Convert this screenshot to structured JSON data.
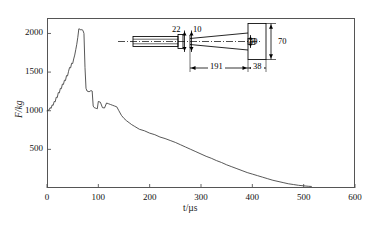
{
  "chart_data": {
    "type": "line",
    "title": "",
    "xlabel": "t/µs",
    "ylabel": "F/kg",
    "xlim": [
      0,
      600
    ],
    "ylim": [
      0,
      2200
    ],
    "grid": false,
    "legend": "none",
    "x_ticks": [
      "0",
      "100",
      "200",
      "300",
      "400",
      "500",
      "600"
    ],
    "x_tick_values": [
      0,
      100,
      200,
      300,
      400,
      500,
      600
    ],
    "y_ticks": [
      "500",
      "1000",
      "1500",
      "2000"
    ],
    "y_tick_values": [
      500,
      1000,
      1500,
      2000
    ],
    "series": [
      {
        "name": "force",
        "x": [
          0,
          2,
          4,
          6,
          8,
          10,
          12,
          14,
          16,
          18,
          20,
          22,
          24,
          26,
          28,
          30,
          32,
          34,
          36,
          38,
          40,
          42,
          44,
          46,
          48,
          50,
          52,
          54,
          56,
          58,
          60,
          62,
          64,
          66,
          68,
          70,
          72,
          74,
          76,
          78,
          80,
          82,
          84,
          86,
          88,
          90,
          92,
          94,
          96,
          98,
          100,
          104,
          108,
          112,
          116,
          120,
          124,
          128,
          132,
          136,
          140,
          145,
          150,
          155,
          160,
          165,
          170,
          180,
          190,
          200,
          210,
          220,
          230,
          240,
          250,
          260,
          270,
          280,
          290,
          300,
          310,
          320,
          330,
          340,
          350,
          360,
          370,
          380,
          390,
          400,
          410,
          420,
          430,
          440,
          450,
          460,
          470,
          480,
          490,
          500,
          510,
          515
        ],
        "y": [
          1000,
          1005,
          1010,
          1040,
          1030,
          1075,
          1070,
          1120,
          1115,
          1175,
          1170,
          1235,
          1230,
          1290,
          1285,
          1345,
          1340,
          1395,
          1390,
          1455,
          1450,
          1510,
          1560,
          1555,
          1615,
          1610,
          1670,
          1720,
          1790,
          1860,
          1950,
          2060,
          2055,
          2045,
          2050,
          2040,
          2000,
          1560,
          1290,
          1255,
          1250,
          1245,
          1255,
          1260,
          1255,
          1060,
          1040,
          1035,
          1030,
          1025,
          1120,
          1110,
          1040,
          1035,
          1100,
          1090,
          1080,
          1070,
          1060,
          1050,
          1000,
          940,
          900,
          870,
          845,
          820,
          800,
          760,
          740,
          710,
          690,
          660,
          640,
          615,
          590,
          560,
          530,
          500,
          470,
          440,
          410,
          385,
          355,
          330,
          300,
          275,
          250,
          225,
          200,
          180,
          160,
          140,
          120,
          100,
          85,
          70,
          55,
          45,
          35,
          28,
          22,
          20
        ]
      }
    ],
    "inset": {
      "description": "schematic-cross-section-of-projectile-and-target",
      "dimensions": [
        {
          "id": "dim-22",
          "label": "22"
        },
        {
          "id": "dim-10",
          "label": "10"
        },
        {
          "id": "dim-40",
          "label": "40"
        },
        {
          "id": "dim-70",
          "label": "70"
        },
        {
          "id": "dim-191",
          "label": "191"
        },
        {
          "id": "dim-38",
          "label": "38"
        }
      ]
    }
  }
}
